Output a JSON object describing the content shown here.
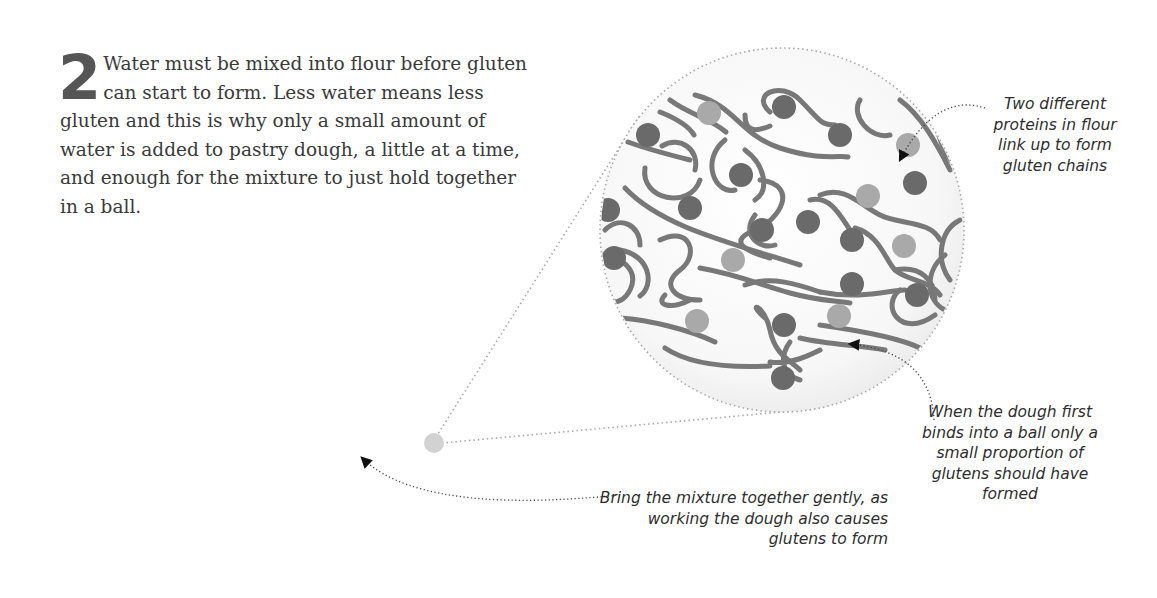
{
  "step": {
    "number": "2",
    "text": "Water must be mixed into flour before gluten can start to form. Less water means less gluten and this is why only a small amount of water is added to pastry dough, a little at a time, and enough for the mixture to just hold together in a ball."
  },
  "callouts": {
    "proteins": "Two different proteins in flour link up to form gluten chains",
    "dough": "When the dough first binds into a ball only a small proportion of glutens should have formed",
    "gentle": "Bring the mixture together gently, as working the dough also causes glutens to form"
  },
  "magnifier": {
    "center": [
      782,
      230
    ],
    "radius": 182,
    "source_dot": [
      434,
      443
    ]
  },
  "colors": {
    "strand": "#787878",
    "protein_dark": "#6a6a6a",
    "protein_light": "#a9a9a9",
    "source_dot": "#d2d2d2",
    "dotted_line": "#a8a8a8",
    "leader": "#444444",
    "lens_fill": "#f5f5f5"
  }
}
